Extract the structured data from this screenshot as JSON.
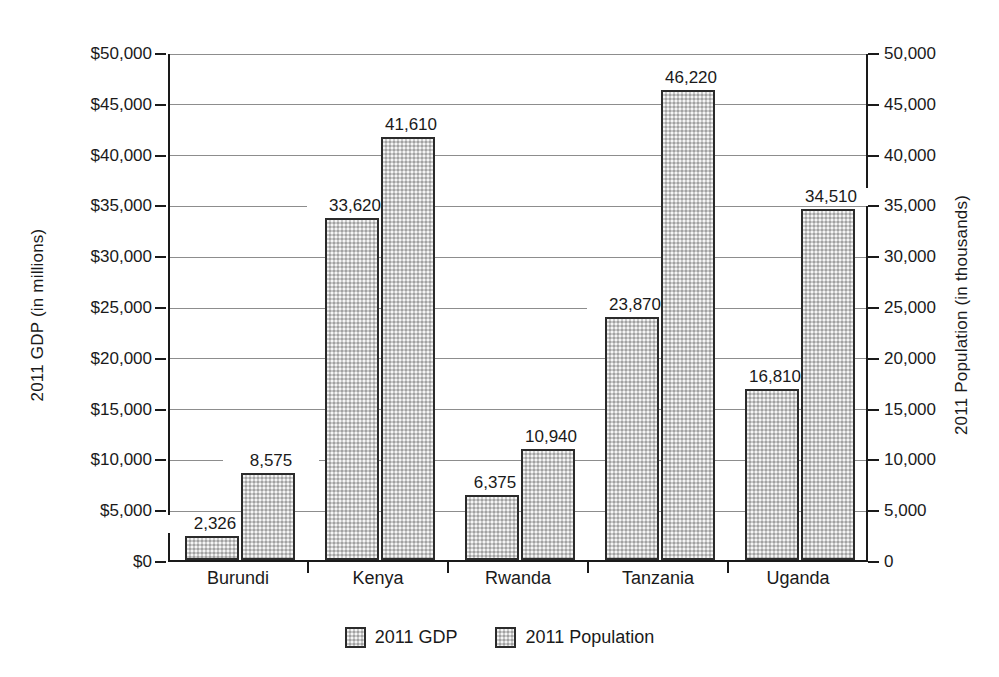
{
  "chart_data": {
    "type": "bar",
    "title": "",
    "categories": [
      "Burundi",
      "Kenya",
      "Rwanda",
      "Tanzania",
      "Uganda"
    ],
    "series": [
      {
        "name": "2011 GDP",
        "axis": "left",
        "unit": "millions of dollars",
        "values": [
          2326,
          33620,
          6375,
          23870,
          16810
        ],
        "labels": [
          "2,326",
          "33,620",
          "6,375",
          "23,870",
          "16,810"
        ]
      },
      {
        "name": "2011 Population",
        "axis": "right",
        "unit": "thousands",
        "values": [
          8575,
          41610,
          10940,
          46220,
          34510
        ],
        "labels": [
          "8,575",
          "41,610",
          "10,940",
          "46,220",
          "34,510"
        ]
      }
    ],
    "xlabel": "",
    "ylabel": "2011 GDP (in millions)",
    "y2label": "2011 Population (in thousands)",
    "ylim": [
      0,
      50000
    ],
    "y2lim": [
      0,
      50000
    ],
    "ytick_labels": [
      "$0",
      "$5,000",
      "$10,000",
      "$15,000",
      "$20,000",
      "$25,000",
      "$30,000",
      "$35,000",
      "$40,000",
      "$45,000",
      "$50,000"
    ],
    "ytick_values": [
      0,
      5000,
      10000,
      15000,
      20000,
      25000,
      30000,
      35000,
      40000,
      45000,
      50000
    ],
    "y2tick_labels": [
      "0",
      "5,000",
      "10,000",
      "15,000",
      "20,000",
      "25,000",
      "30,000",
      "35,000",
      "40,000",
      "45,000",
      "50,000"
    ],
    "y2tick_values": [
      0,
      5000,
      10000,
      15000,
      20000,
      25000,
      30000,
      35000,
      40000,
      45000,
      50000
    ],
    "grid": true,
    "legend_position": "bottom",
    "legend": [
      "2011 GDP",
      "2011 Population"
    ],
    "colors": {
      "bar_fill": "#c9c9c9",
      "bar_border": "#2b2b2b",
      "gridline": "#8d8d8d",
      "axis": "#1a1a1a",
      "background": "#ffffff",
      "text": "#1a1a1a"
    }
  }
}
